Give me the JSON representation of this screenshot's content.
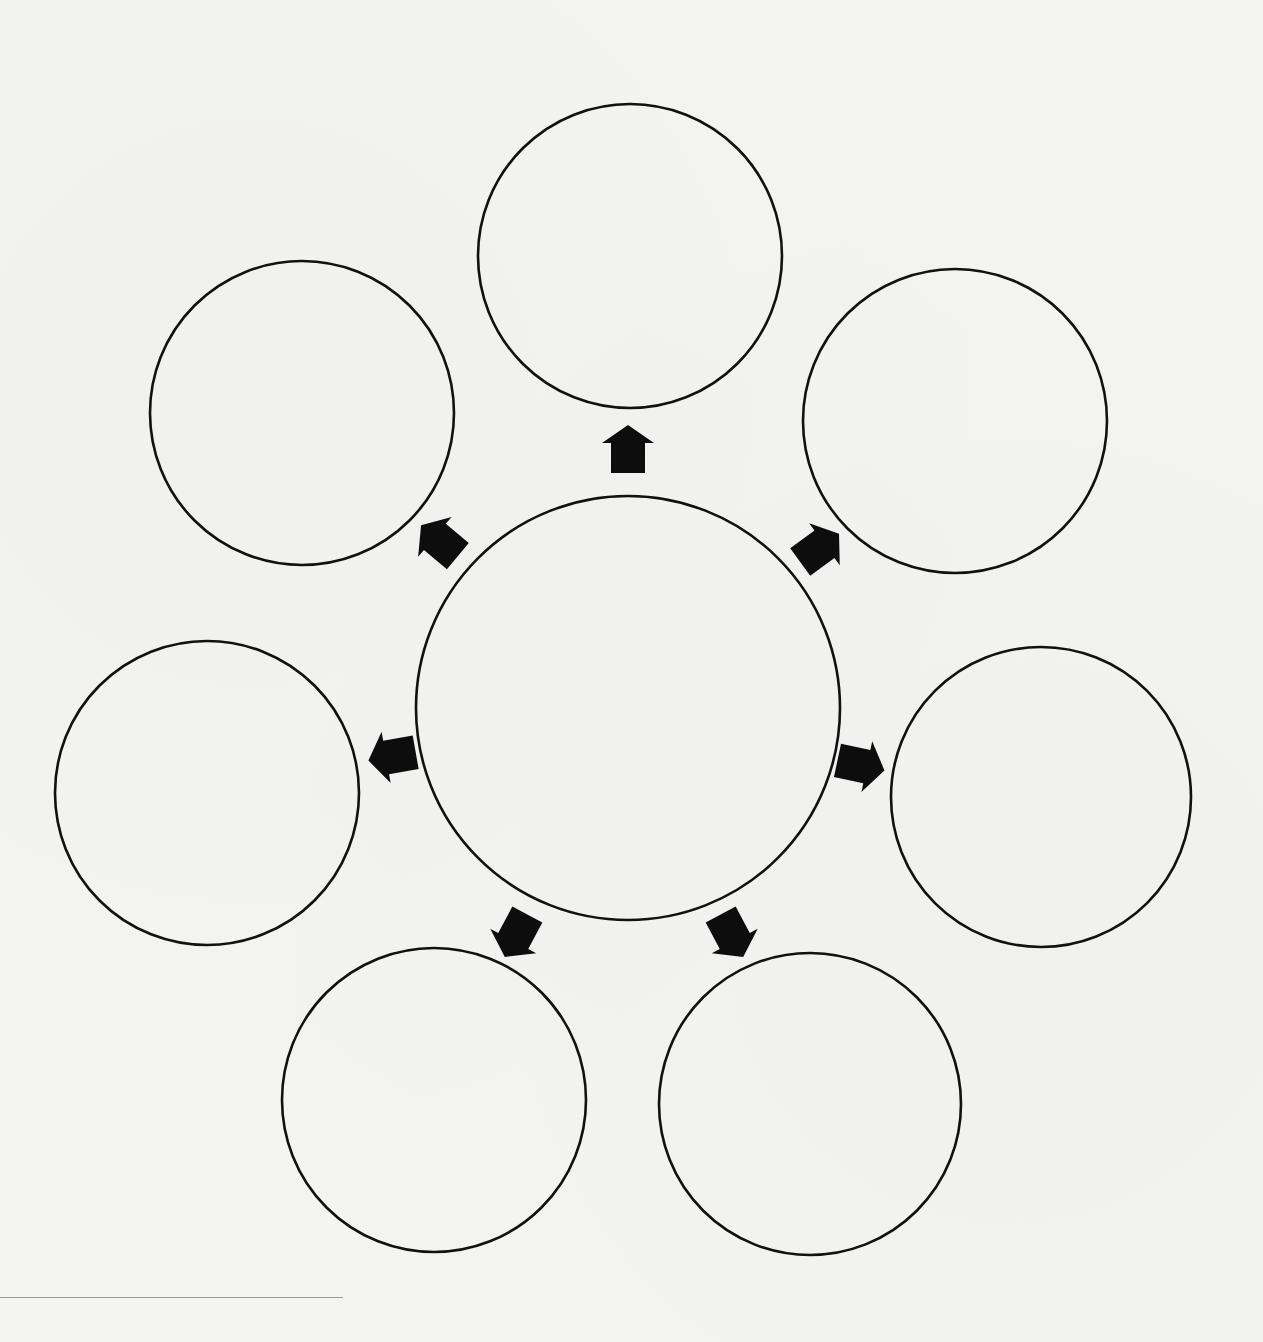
{
  "diagram": {
    "type": "hub-and-spoke",
    "colors": {
      "stroke": "#111111",
      "arrow_fill": "#0d0d0d",
      "background": "#f4f4f2"
    },
    "center": {
      "id": "center",
      "cx": 628,
      "cy": 708,
      "r": 212,
      "label": ""
    },
    "satellites": [
      {
        "id": "top",
        "cx": 630,
        "cy": 256,
        "r": 152,
        "label": ""
      },
      {
        "id": "upper-right",
        "cx": 955,
        "cy": 421,
        "r": 152,
        "label": ""
      },
      {
        "id": "right",
        "cx": 1041,
        "cy": 797,
        "r": 150,
        "label": ""
      },
      {
        "id": "lower-right",
        "cx": 810,
        "cy": 1104,
        "r": 151,
        "label": ""
      },
      {
        "id": "lower-left",
        "cx": 434,
        "cy": 1100,
        "r": 152,
        "label": ""
      },
      {
        "id": "left",
        "cx": 207,
        "cy": 793,
        "r": 152,
        "label": ""
      },
      {
        "id": "upper-left",
        "cx": 302,
        "cy": 413,
        "r": 152,
        "label": ""
      }
    ],
    "arrows": [
      {
        "id": "arrow-to-top",
        "x": 628,
        "y": 451,
        "angle": -90
      },
      {
        "id": "arrow-to-upper-right",
        "x": 818,
        "y": 549,
        "angle": -36
      },
      {
        "id": "arrow-to-right",
        "x": 859,
        "y": 765,
        "angle": 12
      },
      {
        "id": "arrow-to-lower-right",
        "x": 731,
        "y": 934,
        "angle": 62
      },
      {
        "id": "arrow-to-lower-left",
        "x": 517,
        "y": 934,
        "angle": 118
      },
      {
        "id": "arrow-to-left",
        "x": 394,
        "y": 756,
        "angle": 170
      },
      {
        "id": "arrow-to-upper-left",
        "x": 441,
        "y": 542,
        "angle": -140
      }
    ]
  },
  "footnote_rule": {
    "visible": true
  }
}
